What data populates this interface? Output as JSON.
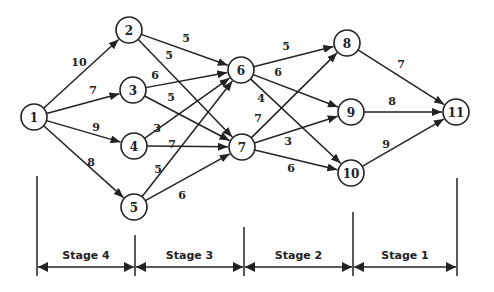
{
  "nodes": [
    {
      "id": "1",
      "label": "1",
      "stage_column": 0
    },
    {
      "id": "2",
      "label": "2",
      "stage_column": 1
    },
    {
      "id": "3",
      "label": "3",
      "stage_column": 1
    },
    {
      "id": "4",
      "label": "4",
      "stage_column": 1
    },
    {
      "id": "5",
      "label": "5",
      "stage_column": 1
    },
    {
      "id": "6",
      "label": "6",
      "stage_column": 2
    },
    {
      "id": "7",
      "label": "7",
      "stage_column": 2
    },
    {
      "id": "8",
      "label": "8",
      "stage_column": 3
    },
    {
      "id": "9",
      "label": "9",
      "stage_column": 3
    },
    {
      "id": "10",
      "label": "10",
      "stage_column": 3
    },
    {
      "id": "11",
      "label": "11",
      "stage_column": 4
    }
  ],
  "edges": [
    {
      "from": "1",
      "to": "2",
      "weight": "10"
    },
    {
      "from": "1",
      "to": "3",
      "weight": "7"
    },
    {
      "from": "1",
      "to": "4",
      "weight": "9"
    },
    {
      "from": "1",
      "to": "5",
      "weight": "8"
    },
    {
      "from": "2",
      "to": "6",
      "weight": "5"
    },
    {
      "from": "2",
      "to": "7",
      "weight": "5"
    },
    {
      "from": "3",
      "to": "6",
      "weight": "6"
    },
    {
      "from": "3",
      "to": "7",
      "weight": "5"
    },
    {
      "from": "4",
      "to": "6",
      "weight": "3"
    },
    {
      "from": "4",
      "to": "7",
      "weight": "7"
    },
    {
      "from": "5",
      "to": "6",
      "weight": "5"
    },
    {
      "from": "5",
      "to": "7",
      "weight": "6"
    },
    {
      "from": "6",
      "to": "8",
      "weight": "5"
    },
    {
      "from": "6",
      "to": "9",
      "weight": "6"
    },
    {
      "from": "6",
      "to": "10",
      "weight": "4"
    },
    {
      "from": "7",
      "to": "8",
      "weight": "7"
    },
    {
      "from": "7",
      "to": "9",
      "weight": "3"
    },
    {
      "from": "7",
      "to": "10",
      "weight": "6"
    },
    {
      "from": "8",
      "to": "11",
      "weight": "7"
    },
    {
      "from": "9",
      "to": "11",
      "weight": "8"
    },
    {
      "from": "10",
      "to": "11",
      "weight": "9"
    }
  ],
  "stages": [
    {
      "label": "Stage 4"
    },
    {
      "label": "Stage 3"
    },
    {
      "label": "Stage 2"
    },
    {
      "label": "Stage 1"
    }
  ],
  "colors": {
    "ink": "#222222",
    "background": "#ffffff"
  }
}
